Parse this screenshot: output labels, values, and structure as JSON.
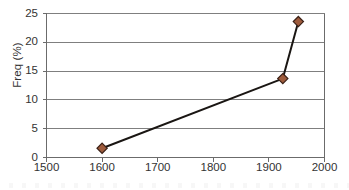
{
  "chart_data": {
    "type": "line",
    "title": "",
    "subtitle": "",
    "xlabel": "",
    "ylabel": "Freq (%)",
    "xlim": [
      1500,
      2000
    ],
    "ylim": [
      0,
      25
    ],
    "x_ticks": [
      1500,
      1600,
      1700,
      1800,
      1900,
      2000
    ],
    "x_tick_labels": [
      "1500",
      "1600",
      "1700",
      "1800",
      "1900",
      "2000"
    ],
    "y_ticks": [
      0,
      5,
      10,
      15,
      20,
      25
    ],
    "y_tick_labels": [
      "0",
      "5",
      "10",
      "15",
      "20",
      "25"
    ],
    "grid": "horizontal",
    "legend": "none",
    "legend_entries": [],
    "annotations": [],
    "series": [
      {
        "name": "Freq",
        "marker": "diamond",
        "marker_color": "#9E5B3C",
        "marker_edge_color": "#3A2016",
        "line_color": "#1A1613",
        "x": [
          1600,
          1925,
          1953
        ],
        "y": [
          1.6,
          13.7,
          23.6
        ],
        "points": [
          {
            "x": 1600,
            "y": 1.6
          },
          {
            "x": 1925,
            "y": 13.7
          },
          {
            "x": 1953,
            "y": 23.6
          }
        ]
      }
    ]
  },
  "axes": {
    "y_title": "Freq (%)"
  },
  "colors": {
    "marker_fill": "#9E5B3C",
    "marker_edge": "#3A2016",
    "line": "#1A1613",
    "gridline": "#7F7F7F",
    "axis": "#6B6B6B",
    "text": "#333333",
    "background": "#FFFFFF"
  }
}
